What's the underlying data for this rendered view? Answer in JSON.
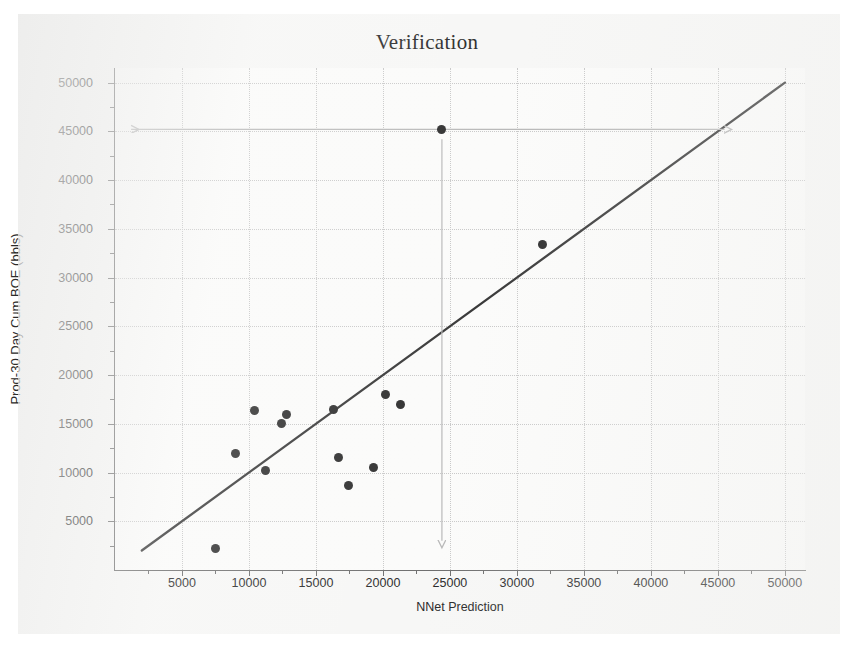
{
  "chart_data": {
    "type": "scatter",
    "title": "Verification",
    "xlabel": "NNet Prediction",
    "ylabel": "Prod-30 Day Cum BOE (bbls)",
    "xlim": [
      0,
      51500
    ],
    "ylim": [
      0,
      51500
    ],
    "xticks": [
      5000,
      10000,
      15000,
      20000,
      25000,
      30000,
      35000,
      40000,
      45000,
      50000
    ],
    "yticks": [
      5000,
      10000,
      15000,
      20000,
      25000,
      30000,
      35000,
      40000,
      45000,
      50000
    ],
    "xtick_labels": [
      "5000",
      "10000",
      "15000",
      "20000",
      "25000",
      "30000",
      "35000",
      "40000",
      "45000",
      "50000"
    ],
    "ytick_labels": [
      "5000",
      "10000",
      "15000",
      "20000",
      "25000",
      "30000",
      "35000",
      "40000",
      "45000",
      "50000"
    ],
    "grid": true,
    "legend": false,
    "series": [
      {
        "name": "Wells",
        "marker": "filled-circle",
        "color": "#2f2f2f",
        "points": [
          {
            "x": 7500,
            "y": 2200
          },
          {
            "x": 9000,
            "y": 12000
          },
          {
            "x": 10400,
            "y": 16400
          },
          {
            "x": 11200,
            "y": 10200
          },
          {
            "x": 12400,
            "y": 15000
          },
          {
            "x": 12800,
            "y": 16000
          },
          {
            "x": 16300,
            "y": 16500
          },
          {
            "x": 16700,
            "y": 11500
          },
          {
            "x": 17400,
            "y": 8700
          },
          {
            "x": 19300,
            "y": 10500
          },
          {
            "x": 20200,
            "y": 18000
          },
          {
            "x": 21300,
            "y": 17000
          },
          {
            "x": 24400,
            "y": 45200
          },
          {
            "x": 31900,
            "y": 33400
          }
        ]
      }
    ],
    "reference_line": {
      "name": "unity-line",
      "description": "y = x diagonal",
      "color": "#3a3a3a",
      "from": {
        "x": 2000,
        "y": 2000
      },
      "to": {
        "x": 50000,
        "y": 50000
      }
    },
    "annotations": [
      {
        "name": "horizontal-arrow",
        "type": "double-arrow",
        "color": "#b9b9b9",
        "y": 45200,
        "x_from": 1200,
        "x_to": 45500
      },
      {
        "name": "vertical-arrow",
        "type": "arrow",
        "color": "#b9b9b9",
        "x": 24400,
        "y_from": 44200,
        "y_to": 3000
      }
    ]
  },
  "colors": {
    "marker": "#2f2f2f",
    "reference_line": "#3a3a3a",
    "annotation_arrow": "#b9b9b9",
    "grid": "#c9c9c9",
    "axis": "#6f6f6f",
    "text": "#2b2b2b",
    "paper": "#f7f7f6"
  }
}
